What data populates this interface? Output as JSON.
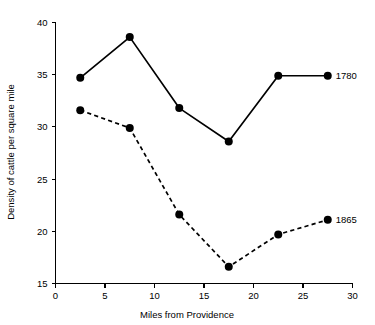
{
  "chart_data": {
    "type": "line",
    "title": "",
    "xlabel": "Miles from Providence",
    "ylabel": "Density of cattle per square mile",
    "xlim": [
      0,
      30
    ],
    "ylim": [
      15,
      40
    ],
    "xticks": [
      0,
      5,
      10,
      15,
      20,
      25,
      30
    ],
    "xtick_labels": [
      "0",
      "5",
      "10",
      "15",
      "20",
      "25",
      "30"
    ],
    "yticks": [
      15,
      20,
      25,
      30,
      35,
      40
    ],
    "ytick_labels": [
      "15",
      "20",
      "25",
      "30",
      "35",
      "40"
    ],
    "grid": false,
    "legend_position": "right-inline-end-of-line",
    "x": [
      2.5,
      7.5,
      12.5,
      17.5,
      22.5,
      27.5
    ],
    "series": [
      {
        "name": "1780",
        "style": "solid",
        "marker": "filled-circle",
        "values": [
          34.7,
          38.6,
          31.8,
          28.6,
          34.9,
          34.9
        ]
      },
      {
        "name": "1865",
        "style": "dashed",
        "marker": "filled-circle",
        "values": [
          31.6,
          29.9,
          21.6,
          16.6,
          19.7,
          21.1
        ]
      }
    ]
  },
  "axes": {
    "x_axis_title": "Miles from Providence",
    "y_axis_title": "Density of cattle per square mile"
  },
  "labels": {
    "series_1780": "1780",
    "series_1865": "1865"
  },
  "colors": {
    "ink": "#000000",
    "background": "#ffffff"
  }
}
